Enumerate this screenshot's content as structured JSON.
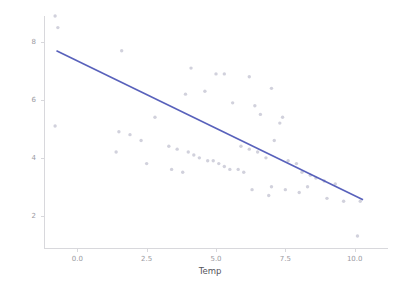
{
  "chart_data": {
    "type": "scatter",
    "title": "",
    "xlabel": "Temp",
    "ylabel": "Gas",
    "xlim": [
      -1.2,
      11.2
    ],
    "ylim": [
      0.85,
      8.9
    ],
    "xticks": [
      0.0,
      2.5,
      5.0,
      7.5,
      10.0
    ],
    "xtick_labels": [
      "0.0",
      "2.5",
      "5.0",
      "7.5",
      "10.0"
    ],
    "yticks": [
      2,
      4,
      6,
      8
    ],
    "ytick_labels": [
      "2",
      "4",
      "6",
      "8"
    ],
    "grid": false,
    "legend": null,
    "marker_color": "#c9c9d6",
    "line_color": "#4a54b5",
    "background_color": "#ffffff",
    "axis_color": "#d8d8dc",
    "series": [
      {
        "name": "Gas vs Temp",
        "type": "scatter",
        "points": [
          [
            -0.8,
            8.9
          ],
          [
            -0.7,
            8.5
          ],
          [
            1.6,
            7.7
          ],
          [
            4.1,
            7.1
          ],
          [
            5.0,
            6.9
          ],
          [
            5.3,
            6.9
          ],
          [
            6.2,
            6.8
          ],
          [
            7.0,
            6.4
          ],
          [
            -0.8,
            5.1
          ],
          [
            1.5,
            4.9
          ],
          [
            1.9,
            4.8
          ],
          [
            3.3,
            4.4
          ],
          [
            3.9,
            6.2
          ],
          [
            4.6,
            6.3
          ],
          [
            5.6,
            5.9
          ],
          [
            6.4,
            5.8
          ],
          [
            2.8,
            5.4
          ],
          [
            6.6,
            5.5
          ],
          [
            7.4,
            5.4
          ],
          [
            7.3,
            5.2
          ],
          [
            2.3,
            4.6
          ],
          [
            3.6,
            4.3
          ],
          [
            4.0,
            4.2
          ],
          [
            4.2,
            4.1
          ],
          [
            4.4,
            4.0
          ],
          [
            4.7,
            3.9
          ],
          [
            4.9,
            3.9
          ],
          [
            5.1,
            3.8
          ],
          [
            5.3,
            3.7
          ],
          [
            5.5,
            3.6
          ],
          [
            5.8,
            3.6
          ],
          [
            6.0,
            3.5
          ],
          [
            1.4,
            4.2
          ],
          [
            2.5,
            3.8
          ],
          [
            3.4,
            3.6
          ],
          [
            3.8,
            3.5
          ],
          [
            5.9,
            4.4
          ],
          [
            6.2,
            4.3
          ],
          [
            6.5,
            4.2
          ],
          [
            6.8,
            4.0
          ],
          [
            7.1,
            4.6
          ],
          [
            7.6,
            3.9
          ],
          [
            7.9,
            3.8
          ],
          [
            8.1,
            3.5
          ],
          [
            8.4,
            3.4
          ],
          [
            8.6,
            3.3
          ],
          [
            8.9,
            3.2
          ],
          [
            9.3,
            3.1
          ],
          [
            7.0,
            3.0
          ],
          [
            7.5,
            2.9
          ],
          [
            8.0,
            2.8
          ],
          [
            8.3,
            3.0
          ],
          [
            9.0,
            2.6
          ],
          [
            9.6,
            2.5
          ],
          [
            10.2,
            2.5
          ],
          [
            6.3,
            2.9
          ],
          [
            6.9,
            2.7
          ],
          [
            10.1,
            1.3
          ]
        ]
      },
      {
        "name": "linear fit",
        "type": "line",
        "x": [
          -0.75,
          10.3
        ],
        "y": [
          7.7,
          2.55
        ]
      }
    ]
  },
  "axes": {
    "x_axis_label": "Temp",
    "y_axis_label": "Gas"
  }
}
